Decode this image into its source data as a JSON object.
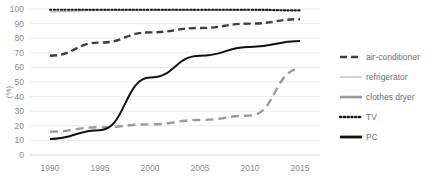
{
  "chart_data": {
    "type": "line",
    "title": "",
    "xlabel": "",
    "ylabel": "(%)",
    "x": [
      1990,
      1995,
      2000,
      2005,
      2010,
      2015
    ],
    "xtick_labels": [
      "1990",
      "1995",
      "2000",
      "2005",
      "2010",
      "2015"
    ],
    "ytick_labels": [
      "0",
      "10",
      "20",
      "30",
      "40",
      "50",
      "60",
      "70",
      "80",
      "90",
      "100"
    ],
    "ylim": [
      0,
      100
    ],
    "xlim": [
      1988,
      2017
    ],
    "grid": "horizontal",
    "legend_position": "right",
    "series": [
      {
        "name": "air-conditioner",
        "style": "dashed",
        "color": "#3f3f3f",
        "width": 2.4,
        "dash": "7,4",
        "values": [
          68,
          77,
          84,
          87,
          90,
          93
        ]
      },
      {
        "name": "refrigerator",
        "style": "solid-thin",
        "color": "#b9b9b9",
        "width": 1.2,
        "dash": "",
        "values": [
          98,
          99,
          99,
          99,
          99,
          99
        ]
      },
      {
        "name": "clothes dryer",
        "style": "dashed-gray",
        "color": "#9a9a9a",
        "width": 2.4,
        "dash": "8,5",
        "values": [
          16,
          19,
          21,
          24,
          27,
          59
        ]
      },
      {
        "name": "TV",
        "style": "dotted",
        "color": "#1c1c1c",
        "width": 2.2,
        "dash": "1.2,2.4",
        "values": [
          99.5,
          99.5,
          99.5,
          99.5,
          99.5,
          99
        ]
      },
      {
        "name": "PC",
        "style": "solid",
        "color": "#111111",
        "width": 2.0,
        "dash": "",
        "values": [
          11,
          17,
          53,
          68,
          74,
          78
        ]
      }
    ]
  },
  "legend": {
    "items": [
      {
        "label": "air-conditioner",
        "swatch": "dashed",
        "color": "#3f3f3f"
      },
      {
        "label": "refrigerator",
        "swatch": "solid-thin",
        "color": "#b9b9b9"
      },
      {
        "label": "clothes dryer",
        "swatch": "solid-thick-gray",
        "color": "#9a9a9a"
      },
      {
        "label": "TV",
        "swatch": "dotted",
        "color": "#1c1c1c"
      },
      {
        "label": "PC",
        "swatch": "solid-thick-black",
        "color": "#111111"
      }
    ]
  },
  "colors": {
    "gridline": "#ebebeb",
    "axis": "#d6d6d6",
    "tick_label": "#8a8a8a",
    "legend_label": "#6f6f6f",
    "background": "#ffffff"
  }
}
